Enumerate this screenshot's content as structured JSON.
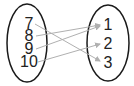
{
  "domain_set": {
    "left": [
      "7",
      "8",
      "9",
      "10"
    ],
    "right": [
      "1",
      "2",
      "3"
    ]
  },
  "mappings": [
    {
      "from": "7",
      "to": "3"
    },
    {
      "from": "8",
      "to": "1"
    },
    {
      "from": "9",
      "to": "1"
    },
    {
      "from": "10",
      "to": "2"
    }
  ],
  "colors": {
    "ellipse": "#1a1a1a",
    "arrow": "#b0b0b0",
    "text": "#222222"
  }
}
